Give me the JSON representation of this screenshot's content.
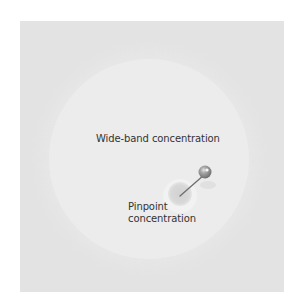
{
  "diagram": {
    "wide_label": "Wide-band concentration",
    "pinpoint_label_line1": "Pinpoint",
    "pinpoint_label_line2": "concentration",
    "icons": {
      "pin": "pushpin-icon"
    },
    "colors": {
      "background": "#ffffff",
      "panel": "#e3e3e3",
      "wide_circle": "#ececec",
      "pinpoint_spot": "#d9d9d9",
      "pin_head": "#9a9a9a",
      "pin_needle": "#6e6e6e",
      "text": "#333333"
    }
  }
}
